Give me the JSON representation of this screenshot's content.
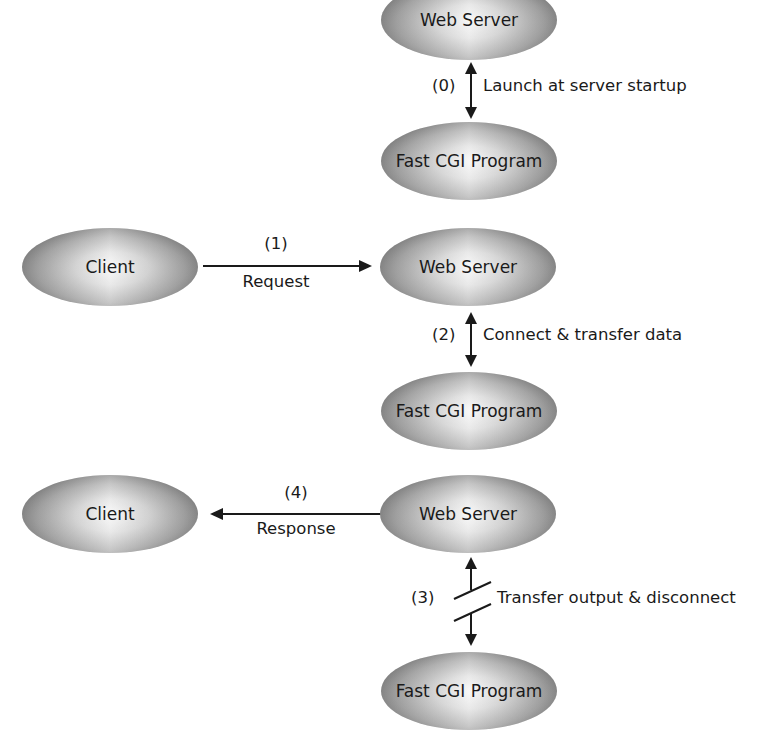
{
  "diagram": {
    "nodes": {
      "web_server_0": "Web Server",
      "fastcgi_0": "Fast CGI Program",
      "client_1": "Client",
      "web_server_1": "Web Server",
      "fastcgi_1": "Fast CGI Program",
      "client_2": "Client",
      "web_server_2": "Web Server",
      "fastcgi_2": "Fast CGI Program"
    },
    "steps": {
      "step0": {
        "num": "(0)",
        "label": "Launch at server startup"
      },
      "step1": {
        "num": "(1)",
        "label": "Request"
      },
      "step2": {
        "num": "(2)",
        "label": "Connect & transfer data"
      },
      "step3": {
        "num": "(3)",
        "label": "Transfer output & disconnect"
      },
      "step4": {
        "num": "(4)",
        "label": "Response"
      }
    }
  },
  "colors": {
    "background": "#ffffff",
    "ellipse_dark": "#8a8a8a",
    "ellipse_light": "#f4f4f4",
    "line": "#1a1a1a"
  }
}
